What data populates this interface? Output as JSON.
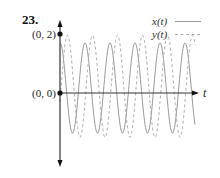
{
  "problem_number": "23.",
  "chart_data": {
    "type": "line",
    "title": "23.",
    "xlabel": "t",
    "ylabel": "",
    "grid": false,
    "legend_position": "top-right",
    "annotations": [
      {
        "label": "(0, 2)",
        "x": 0,
        "y": 2
      },
      {
        "label": "(0, 0)",
        "x": 0,
        "y": 0
      }
    ],
    "series": [
      {
        "name": "x(t)",
        "style": "solid",
        "color": "#9a9a9a",
        "offset": 0.17,
        "amplitude": 1.53,
        "phase": 0,
        "kind": "cos",
        "approx_max": 1.7,
        "approx_min": -1.36
      },
      {
        "name": "y(t)",
        "style": "dashed",
        "color": "#b0b0b0",
        "offset": 0.23,
        "amplitude": 1.73,
        "phase": -0.05,
        "kind": "sin",
        "approx_max": 1.97,
        "approx_min": -1.5
      }
    ],
    "periods_shown": 5.4,
    "ylim": [
      -2.5,
      2.4
    ],
    "pixel_map": {
      "origin_x": 60,
      "origin_y": 93,
      "px_per_unit_y": 29.5,
      "period_px": 25,
      "t_axis_end_x": 197
    }
  },
  "legend": {
    "x_label": "x(t)",
    "y_label": "y(t)"
  },
  "labels": {
    "point_top": "(0, 2)",
    "point_origin": "(0, 0)",
    "t_axis": "t"
  }
}
